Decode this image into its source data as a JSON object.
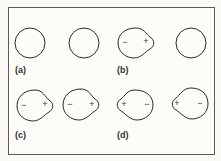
{
  "figure": {
    "panels": [
      {
        "label": "(a)",
        "description": "two isolated spherical atoms, undistorted"
      },
      {
        "label": "(b)",
        "description": "one atom polarized (instantaneous dipole), neighbor undistorted"
      },
      {
        "label": "(c)",
        "description": "induced dipole: both atoms polarized - +, - +"
      },
      {
        "label": "(d)",
        "description": "both atoms polarized reversed + -, + -"
      }
    ],
    "signs": {
      "minus": "−",
      "plus": "+"
    }
  },
  "colors": {
    "stroke": "#2a2a2a",
    "frame": "#5a5a5a",
    "background": "#fdfcf8"
  }
}
